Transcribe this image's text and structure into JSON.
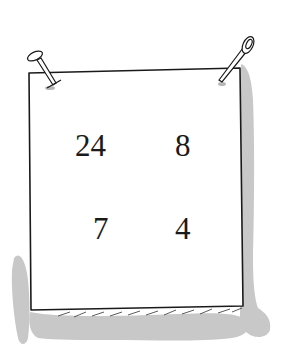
{
  "illustration": {
    "subject": "pinned paper sheet with numbers",
    "numbers": {
      "top_left": "24",
      "top_right": "8",
      "bottom_left": "7",
      "bottom_right": "4"
    },
    "colors": {
      "ink": "#1a1a1a",
      "shadow": "#c8c8c8",
      "paper": "#ffffff"
    }
  }
}
